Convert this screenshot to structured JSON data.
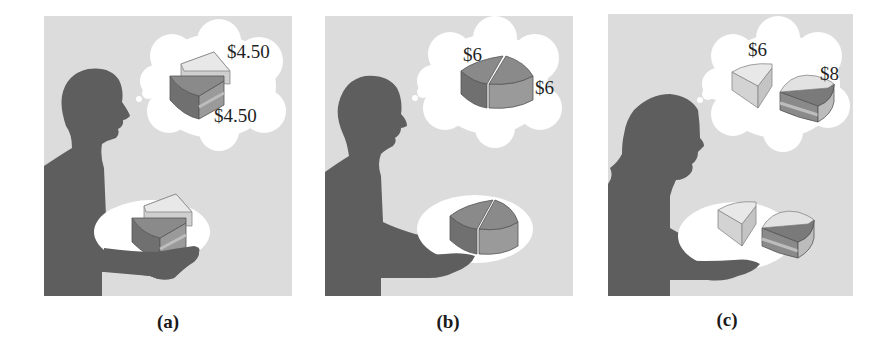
{
  "figure": {
    "panels": [
      {
        "id": "a",
        "caption": "(a)",
        "person": "man",
        "thought_prices": [
          "$4.50",
          "$4.50"
        ],
        "description": "Two separate wedges of pie, each priced $4.50"
      },
      {
        "id": "b",
        "caption": "(b)",
        "person": "man",
        "thought_prices": [
          "$6",
          "$6"
        ],
        "description": "Two pie slices joined as halves of one pie, each priced $6"
      },
      {
        "id": "c",
        "caption": "(c)",
        "person": "woman",
        "thought_prices": [
          "$6",
          "$8"
        ],
        "description": "A plain wedge priced $6 and a layered wedge priced $8"
      }
    ],
    "colors": {
      "panel_background": "#dcdcdc",
      "silhouette": "#5e5e5e",
      "cloud_and_plate": "#ffffff",
      "dark_pie_top": "#8a8a8a",
      "dark_pie_side": "#767676",
      "light_pie_top": "#e6e6e6",
      "light_pie_side": "#cfcfcf"
    }
  }
}
